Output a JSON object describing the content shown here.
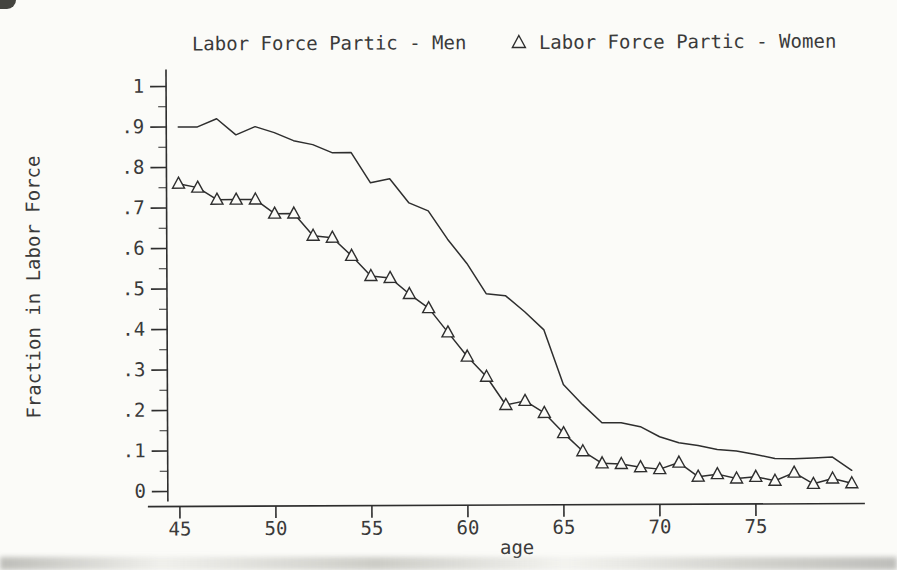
{
  "legend": {
    "men_marker": "line",
    "women_marker": "open-triangle"
  },
  "chart_data": {
    "type": "line",
    "title": "",
    "xlabel": "age",
    "ylabel": "Fraction in Labor Force",
    "grid": false,
    "legend_position": "top",
    "line_color": "#2e2e2e",
    "background_color": "#fbfbf8",
    "xlim": [
      44,
      80.5
    ],
    "ylim": [
      0,
      1
    ],
    "x_ticks": [
      45,
      50,
      55,
      60,
      65,
      70,
      75
    ],
    "x_tick_labels": [
      "45",
      "50",
      "55",
      "60",
      "65",
      "70",
      "75"
    ],
    "y_ticks": [
      0,
      0.1,
      0.2,
      0.3,
      0.4,
      0.5,
      0.6,
      0.7,
      0.8,
      0.9,
      1
    ],
    "y_tick_labels": [
      "0",
      ".1",
      ".2",
      ".3",
      ".4",
      ".5",
      ".6",
      ".7",
      ".8",
      ".9",
      "1"
    ],
    "y_minor_tick_step": 0.05,
    "x": [
      45,
      46,
      47,
      48,
      49,
      50,
      51,
      52,
      53,
      54,
      55,
      56,
      57,
      58,
      59,
      60,
      61,
      62,
      63,
      64,
      65,
      66,
      67,
      68,
      69,
      70,
      71,
      72,
      73,
      74,
      75,
      76,
      77,
      78,
      79,
      80
    ],
    "series": [
      {
        "name": "Labor Force Partic - Men",
        "marker": "none",
        "values": [
          0.9,
          0.9,
          0.92,
          0.88,
          0.9,
          0.885,
          0.865,
          0.855,
          0.835,
          0.835,
          0.76,
          0.77,
          0.71,
          0.69,
          0.62,
          0.56,
          0.485,
          0.48,
          0.44,
          0.395,
          0.26,
          0.21,
          0.165,
          0.165,
          0.155,
          0.13,
          0.115,
          0.108,
          0.098,
          0.094,
          0.085,
          0.075,
          0.074,
          0.076,
          0.078,
          0.045
        ]
      },
      {
        "name": "Labor Force Partic - Women",
        "marker": "open-triangle",
        "values": [
          0.76,
          0.75,
          0.72,
          0.72,
          0.72,
          0.685,
          0.685,
          0.63,
          0.625,
          0.58,
          0.53,
          0.525,
          0.485,
          0.45,
          0.39,
          0.33,
          0.28,
          0.21,
          0.22,
          0.19,
          0.14,
          0.095,
          0.065,
          0.063,
          0.055,
          0.05,
          0.066,
          0.031,
          0.037,
          0.026,
          0.03,
          0.02,
          0.04,
          0.012,
          0.025,
          0.013
        ]
      }
    ]
  }
}
